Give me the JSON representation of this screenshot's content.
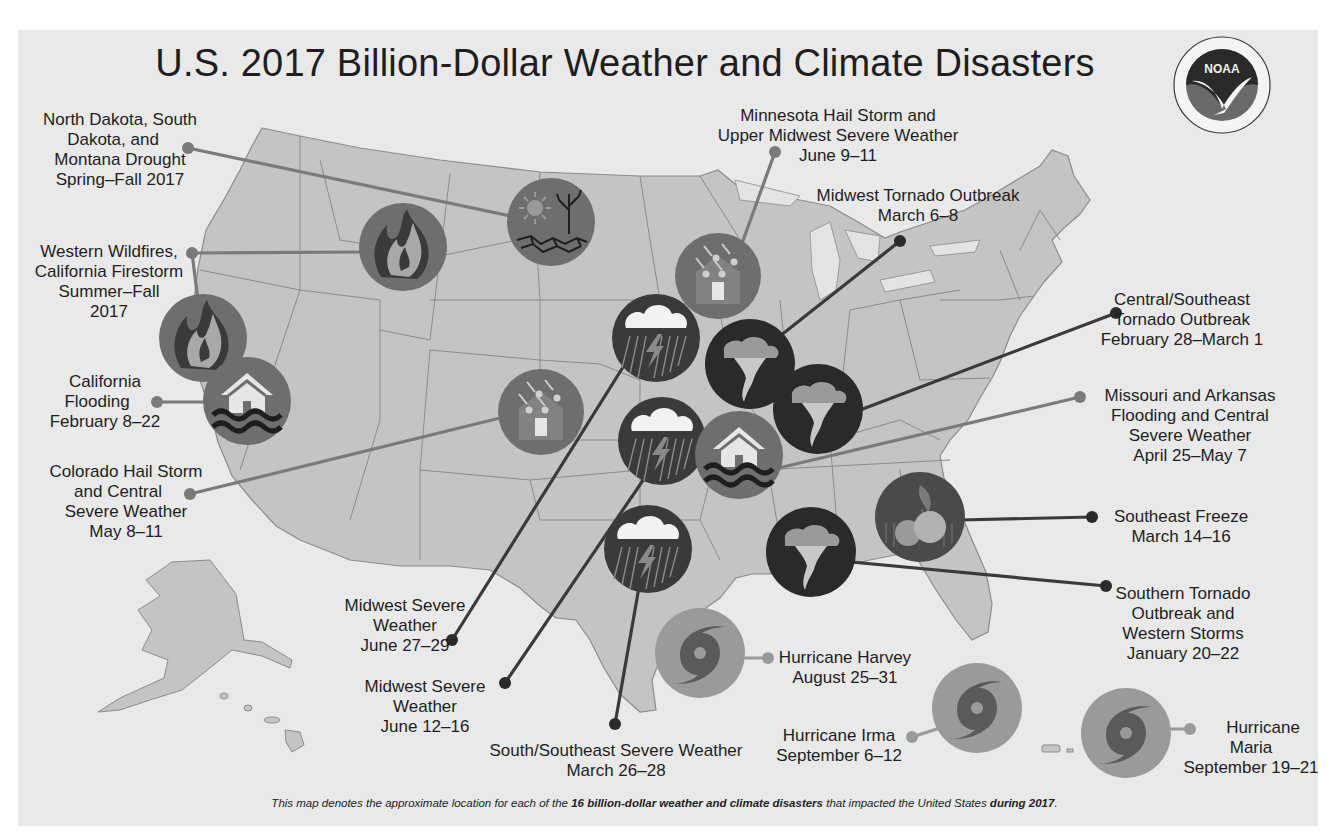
{
  "title": "U.S. 2017 Billion-Dollar Weather and Climate Disasters",
  "logo": {
    "text": "NOAA",
    "ring_text_top": "NATIONAL OCEANIC AND ATMOSPHERIC ADMINISTRATION",
    "ring_text_bottom": "U.S. DEPARTMENT OF COMMERCE"
  },
  "footnote": {
    "part1": "This map denotes the approximate location for each of the ",
    "bold1": "16 billion-dollar weather and climate disasters",
    "part2": " that impacted the United States ",
    "bold2": "during 2017",
    "part3": "."
  },
  "colors": {
    "panel_bg": "#e9e9e9",
    "land": "#c4c4c4",
    "state_border": "#8c8c8c",
    "icon_dark": "#2a2a2a",
    "icon_mid": "#6e6e6e",
    "icon_light": "#9a9a9a",
    "line_dark": "#3a3a3a",
    "line_mid": "#7a7a7a"
  },
  "events": [
    {
      "id": "nd-sd-mt-drought",
      "type": "drought",
      "lines": [
        "North Dakota, South",
        "Dakota, and",
        "Montana Drought",
        "Spring–Fall 2017"
      ]
    },
    {
      "id": "western-wildfires",
      "type": "wildfire",
      "lines": [
        "Western Wildfires,",
        "California Firestorm",
        "Summer–Fall",
        "2017"
      ]
    },
    {
      "id": "california-flooding",
      "type": "flooding",
      "lines": [
        "California",
        "Flooding",
        "February 8–22"
      ]
    },
    {
      "id": "colorado-hail",
      "type": "hail",
      "lines": [
        "Colorado Hail Storm",
        "and Central",
        "Severe Weather",
        "May 8–11"
      ]
    },
    {
      "id": "minnesota-hail",
      "type": "hail",
      "lines": [
        "Minnesota Hail Storm and",
        "Upper Midwest Severe Weather",
        "June 9–11"
      ]
    },
    {
      "id": "midwest-tornado",
      "type": "tornado",
      "lines": [
        "Midwest Tornado Outbreak",
        "March 6–8"
      ]
    },
    {
      "id": "central-se-tornado",
      "type": "tornado",
      "lines": [
        "Central/Southeast",
        "Tornado Outbreak",
        "February 28–March 1"
      ]
    },
    {
      "id": "mo-ar-flooding",
      "type": "flooding",
      "lines": [
        "Missouri and Arkansas",
        "Flooding and Central",
        "Severe Weather",
        "April 25–May 7"
      ]
    },
    {
      "id": "se-freeze",
      "type": "freeze",
      "lines": [
        "Southeast Freeze",
        "March 14–16"
      ]
    },
    {
      "id": "southern-tornado",
      "type": "tornado",
      "lines": [
        "Southern Tornado",
        "Outbreak and",
        "Western Storms",
        "January 20–22"
      ]
    },
    {
      "id": "midwest-severe-jun27",
      "type": "severe",
      "lines": [
        "Midwest Severe",
        "Weather",
        "June 27–29"
      ]
    },
    {
      "id": "midwest-severe-jun12",
      "type": "severe",
      "lines": [
        "Midwest Severe",
        "Weather",
        "June 12–16"
      ]
    },
    {
      "id": "south-se-severe",
      "type": "severe",
      "lines": [
        "South/Southeast Severe Weather",
        "March 26–28"
      ]
    },
    {
      "id": "hurricane-harvey",
      "type": "hurricane",
      "lines": [
        "Hurricane Harvey",
        "August 25–31"
      ]
    },
    {
      "id": "hurricane-irma",
      "type": "hurricane",
      "lines": [
        "Hurricane Irma",
        "September 6–12"
      ]
    },
    {
      "id": "hurricane-maria",
      "type": "hurricane",
      "lines": [
        "Hurricane",
        "Maria",
        "September 19–21"
      ]
    }
  ]
}
